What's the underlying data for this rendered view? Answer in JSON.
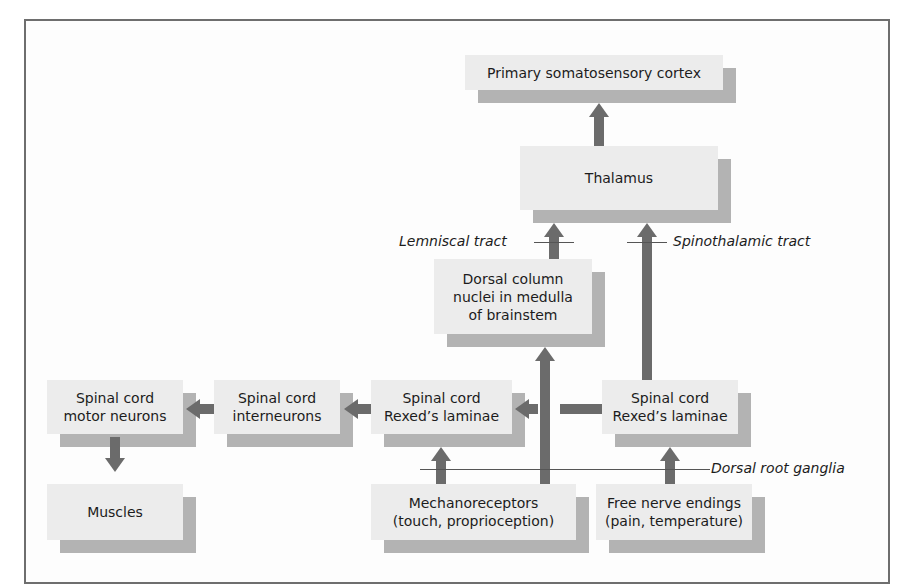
{
  "diagram": {
    "nodes": {
      "cortex": "Primary somatosensory cortex",
      "thalamus": "Thalamus",
      "dorsal_column": "Dorsal column nuclei in medulla of brainstem",
      "motor_neurons": "Spinal cord motor neurons",
      "interneurons": "Spinal cord interneurons",
      "rexed_left": "Spinal cord Rexed’s laminae",
      "rexed_right": "Spinal cord Rexed’s laminae",
      "muscles": "Muscles",
      "mechanoreceptors": "Mechanoreceptors (touch, proprioception)",
      "free_nerve_endings": "Free nerve endings (pain, temperature)"
    },
    "node_lines": {
      "dorsal_column": [
        "Dorsal column",
        "nuclei in medulla",
        "of brainstem"
      ],
      "motor_neurons": [
        "Spinal cord",
        "motor neurons"
      ],
      "interneurons": [
        "Spinal cord",
        "interneurons"
      ],
      "rexed_left": [
        "Spinal cord",
        "Rexed’s laminae"
      ],
      "rexed_right": [
        "Spinal cord",
        "Rexed’s laminae"
      ],
      "mechanoreceptors": [
        "Mechanoreceptors",
        "(touch, proprioception)"
      ],
      "free_nerve_endings": [
        "Free nerve endings",
        "(pain, temperature)"
      ]
    },
    "labels": {
      "lemniscal": "Lemniscal tract",
      "spinothalamic": "Spinothalamic tract",
      "dorsal_root": "Dorsal root ganglia"
    },
    "edges": [
      {
        "from": "thalamus",
        "to": "cortex"
      },
      {
        "from": "dorsal_column",
        "to": "thalamus"
      },
      {
        "from": "rexed_right",
        "to": "thalamus"
      },
      {
        "from": "mechanoreceptors",
        "to": "dorsal_column"
      },
      {
        "from": "mechanoreceptors",
        "to": "rexed_left"
      },
      {
        "from": "rexed_right",
        "to": "rexed_left"
      },
      {
        "from": "rexed_left",
        "to": "interneurons"
      },
      {
        "from": "interneurons",
        "to": "motor_neurons"
      },
      {
        "from": "motor_neurons",
        "to": "muscles"
      },
      {
        "from": "free_nerve_endings",
        "to": "rexed_right"
      }
    ],
    "colors": {
      "box_face": "#ececec",
      "box_shadow": "#b3b3b3",
      "arrow": "#6b6b6b",
      "frame": "#6e6e6e"
    }
  }
}
